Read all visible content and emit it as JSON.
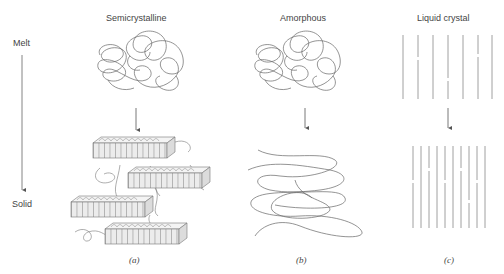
{
  "columns": [
    {
      "title": "Semicrystalline",
      "caption": "(a)"
    },
    {
      "title": "Amorphous",
      "caption": "(b)"
    },
    {
      "title": "Liquid crystal",
      "caption": "(c)"
    }
  ],
  "axis": {
    "top_label": "Melt",
    "bottom_label": "Solid"
  },
  "colors": {
    "line": "#777777",
    "text": "#444444",
    "block_fill": "#e8e8e8"
  }
}
